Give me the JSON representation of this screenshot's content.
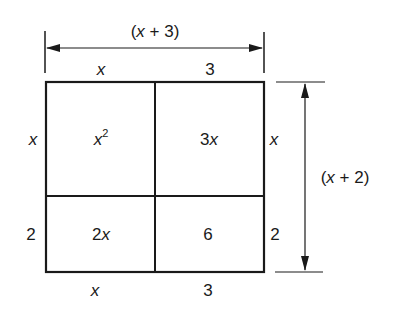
{
  "diagram": {
    "type": "area-model",
    "top_dimension": "(x + 3)",
    "right_dimension": "(x + 2)",
    "top_segments": [
      "x",
      "3"
    ],
    "bottom_segments": [
      "x",
      "3"
    ],
    "left_segments": [
      "x",
      "2"
    ],
    "right_segments": [
      "x",
      "2"
    ],
    "cells": {
      "top_left_base": "x",
      "top_left_exp": "2",
      "top_right": "3x",
      "bottom_left": "2x",
      "bottom_right": "6"
    }
  }
}
